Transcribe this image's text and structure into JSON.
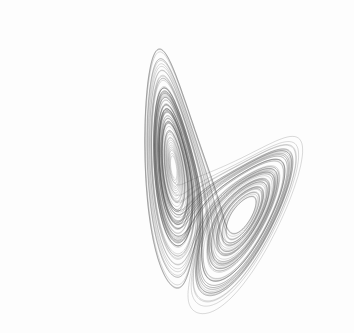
{
  "image": {
    "title": "Lorenz attractor",
    "background": "#ffffff",
    "stroke_color": "#3a3a3a"
  },
  "attractor": {
    "sigma": 10,
    "rho": 28,
    "beta": 2.6667,
    "dt": 0.004,
    "steps": 26000,
    "initial": [
      0.1,
      0.0,
      0.0
    ],
    "projection": {
      "scale_x": 5.4,
      "scale_y": 5.4,
      "offset_x": 178,
      "offset_y": 330,
      "rotate_deg": -38
    }
  }
}
